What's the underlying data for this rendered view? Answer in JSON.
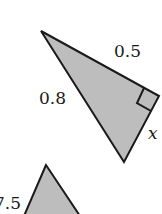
{
  "diagram": {
    "colors": {
      "fill": "#bdbdbd",
      "stroke": "#1a1a1a",
      "text": "#1a1a1a"
    },
    "triangles": [
      {
        "id": "right-triangle",
        "vertices": [
          [
            41,
            31
          ],
          [
            159,
            96
          ],
          [
            124,
            162
          ]
        ],
        "right_angle_at": [
          159,
          96
        ],
        "labels": {
          "hypotenuse": "0.8",
          "top_leg": "0.5",
          "unknown_leg": "x"
        }
      },
      {
        "id": "second-triangle",
        "vertices": [
          [
            46,
            165
          ],
          [
            24,
            216
          ],
          [
            80,
            216
          ]
        ],
        "labels": {
          "left_side": "7.5"
        }
      }
    ]
  }
}
